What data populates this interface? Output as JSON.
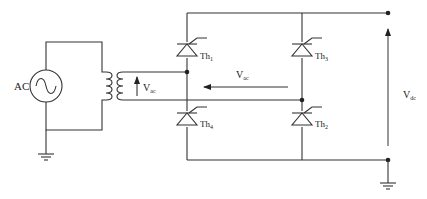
{
  "diagram": {
    "type": "single-phase full-bridge thyristor rectifier",
    "source": {
      "label": "AC",
      "icon": "ac-source-sine-icon"
    },
    "transformer": {
      "icon": "transformer-coil-icon"
    },
    "labels": {
      "vac_secondary": "V",
      "vac_secondary_sub": "ac",
      "vac_bridge": "V",
      "vac_bridge_sub": "ac",
      "vdc": "V",
      "vdc_sub": "dc"
    },
    "thyristors": [
      {
        "id": "th1",
        "label": "Th",
        "sub": "1"
      },
      {
        "id": "th3",
        "label": "Th",
        "sub": "3"
      },
      {
        "id": "th4",
        "label": "Th",
        "sub": "4"
      },
      {
        "id": "th2",
        "label": "Th",
        "sub": "2"
      }
    ],
    "grounds": [
      "source-ground",
      "output-ground"
    ],
    "colors": {
      "line": "#333333",
      "background": "#ffffff"
    }
  }
}
